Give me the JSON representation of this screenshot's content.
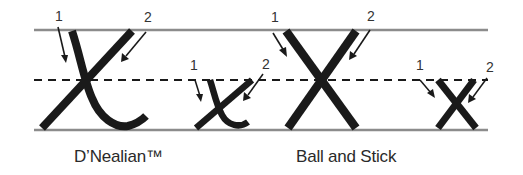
{
  "colors": {
    "guide_line": "#8c8c8c",
    "stroke": "#1a1a1a",
    "dash": "#1a1a1a",
    "text": "#2a2a2a"
  },
  "guides": {
    "top_y": 30,
    "mid_y": 80,
    "bottom_y": 130,
    "x_start": 34,
    "x_end": 488
  },
  "styles": [
    {
      "name": "D'Nealian",
      "label": "D’Nealian™",
      "letters": [
        {
          "case": "uppercase",
          "char": "X",
          "stroke_numbers": [
            "1",
            "2"
          ]
        },
        {
          "case": "lowercase",
          "char": "x",
          "stroke_numbers": [
            "1",
            "2"
          ]
        }
      ]
    },
    {
      "name": "Ball and Stick",
      "label": "Ball and Stick",
      "letters": [
        {
          "case": "uppercase",
          "char": "X",
          "stroke_numbers": [
            "1",
            "2"
          ]
        },
        {
          "case": "lowercase",
          "char": "x",
          "stroke_numbers": [
            "1",
            "2"
          ]
        }
      ]
    }
  ],
  "stroke_labels": {
    "one": "1",
    "two": "2"
  }
}
